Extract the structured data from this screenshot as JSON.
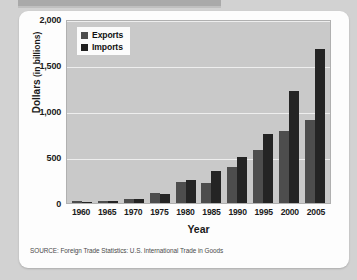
{
  "chart_data": {
    "type": "bar",
    "title": "",
    "xlabel": "Year",
    "ylabel_strong": "Dollars",
    "ylabel_light": " (in billions)",
    "categories": [
      "1960",
      "1965",
      "1970",
      "1975",
      "1980",
      "1985",
      "1990",
      "1995",
      "2000",
      "2005"
    ],
    "series": [
      {
        "name": "Exports",
        "color": "#4d4d4d",
        "values": [
          20,
          27,
          43,
          108,
          225,
          218,
          395,
          575,
          780,
          900
        ]
      },
      {
        "name": "Imports",
        "color": "#242424",
        "values": [
          15,
          21,
          40,
          98,
          245,
          345,
          495,
          745,
          1220,
          1670
        ]
      }
    ],
    "ylim": [
      0,
      2000
    ],
    "ytick_labels": [
      "0",
      "500",
      "1,000",
      "1,500",
      "2,000"
    ],
    "ytick_values": [
      0,
      500,
      1000,
      1500,
      2000
    ],
    "grid": true,
    "legend_position": "top-left"
  },
  "legend": {
    "items": [
      {
        "label": "Exports",
        "swatch": "exports-swatch"
      },
      {
        "label": "Imports",
        "swatch": "imports-swatch"
      }
    ]
  },
  "source": {
    "note": "SOURCE: Foreign Trade Statistics: U.S. International Trade in Goods"
  },
  "colors": {
    "page_background": "#d2d2d2",
    "card_background": "#fdfdfd",
    "plot_background": "#c9c9c9",
    "gridline": "#eeeeee",
    "exports": "#4d4d4d",
    "imports": "#242424",
    "text": "#1a1a1a"
  }
}
